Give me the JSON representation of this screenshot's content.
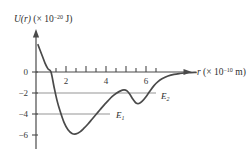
{
  "chart_data": {
    "type": "line",
    "title": "",
    "ylabel": "U(r) (× 10⁻²⁰ J)",
    "xlabel": "r (× 10⁻¹⁰ m)",
    "xlim": [
      0,
      8
    ],
    "ylim": [
      -7,
      3
    ],
    "grid": false,
    "xticks": [
      1,
      2,
      3,
      4,
      5,
      6,
      7
    ],
    "xtick_labels": [
      "",
      "2",
      "",
      "4",
      "",
      "6",
      ""
    ],
    "yticks": [
      0,
      -2,
      -4,
      -6
    ],
    "ytick_labels": [
      "0",
      "−2",
      "−4",
      "−6"
    ],
    "curve_color": "#4a4a4a",
    "level_color": "#b8b8b8",
    "axis_color": "#4a4a4a",
    "series": [
      {
        "name": "U(r)",
        "x": [
          0.1,
          0.3,
          0.45,
          0.6,
          0.75,
          0.9,
          1.05,
          1.2,
          1.4,
          1.6,
          1.8,
          2.0,
          2.2,
          2.4,
          2.6,
          2.8,
          3.0,
          3.2,
          3.4,
          3.6,
          3.8,
          4.0,
          4.2,
          4.4,
          4.55,
          4.7,
          4.85,
          5.0,
          5.15,
          5.3,
          5.5,
          5.7,
          5.9,
          6.1,
          6.3,
          6.6,
          6.9,
          7.2,
          7.6,
          8.0
        ],
        "y": [
          2.6,
          1.6,
          0.85,
          0.3,
          0.0,
          -1.4,
          -2.7,
          -3.7,
          -4.8,
          -5.5,
          -5.85,
          -5.9,
          -5.7,
          -5.35,
          -4.95,
          -4.5,
          -4.05,
          -3.6,
          -3.15,
          -2.75,
          -2.35,
          -2.05,
          -1.82,
          -1.7,
          -1.8,
          -2.15,
          -2.6,
          -2.95,
          -3.0,
          -2.8,
          -2.35,
          -1.8,
          -1.3,
          -0.92,
          -0.65,
          -0.38,
          -0.22,
          -0.14,
          -0.07,
          -0.04
        ]
      }
    ],
    "energy_levels": [
      {
        "name": "E1",
        "label": "E",
        "subscript": "1",
        "value": -4,
        "x_start": 0,
        "x_end": 3.7,
        "label_x": 4.0
      },
      {
        "name": "E2",
        "label": "E",
        "subscript": "2",
        "value": -2,
        "x_start": 0,
        "x_end": 6.0,
        "label_x": 6.3
      }
    ],
    "annotations": [
      {
        "name": "local-max",
        "x": 4.4,
        "y": -1.7
      },
      {
        "name": "local-min-outer",
        "x": 5.1,
        "y": -3.0
      },
      {
        "name": "global-min",
        "x": 2.0,
        "y": -5.9
      }
    ]
  },
  "labels": {
    "y_axis_prefix": "U(r)",
    "y_axis_paren_open": " (× 10",
    "y_axis_exponent": "−20",
    "y_axis_paren_close": " J)",
    "x_axis_prefix": "r",
    "x_axis_paren_open": " (× 10",
    "x_axis_exponent": "−10",
    "x_axis_paren_close": " m)"
  }
}
